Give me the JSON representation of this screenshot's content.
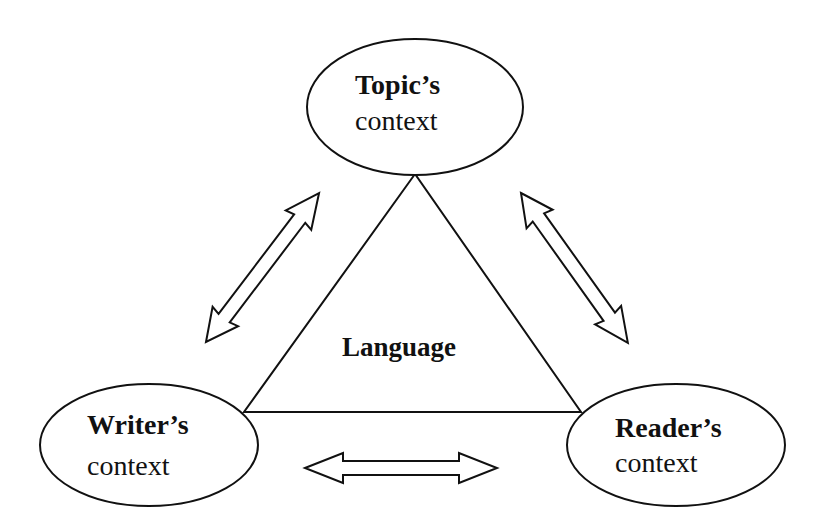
{
  "diagram": {
    "center": {
      "label": "Language"
    },
    "nodes": {
      "topic": {
        "title": "Topic’s",
        "subtitle": "context"
      },
      "writer": {
        "title": "Writer’s",
        "subtitle": "context"
      },
      "reader": {
        "title": "Reader’s",
        "subtitle": "context"
      }
    },
    "edges": [
      {
        "from": "topic",
        "to": "writer",
        "type": "bidirectional"
      },
      {
        "from": "topic",
        "to": "reader",
        "type": "bidirectional"
      },
      {
        "from": "writer",
        "to": "reader",
        "type": "bidirectional"
      }
    ],
    "colors": {
      "stroke": "#111111",
      "background": "#ffffff"
    }
  }
}
